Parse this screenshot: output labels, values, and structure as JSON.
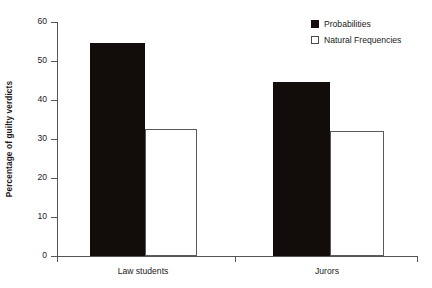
{
  "chart_data": {
    "type": "bar",
    "title": "",
    "xlabel": "",
    "ylabel": "Percentage of guilty verdicts",
    "categories": [
      "Law students",
      "Jurors"
    ],
    "series": [
      {
        "name": "Probabilities",
        "values": [
          54.5,
          44.5
        ],
        "style": "filled",
        "color": "#120d0b"
      },
      {
        "name": "Natural Frequencies",
        "values": [
          32.5,
          32.0
        ],
        "style": "open",
        "color": "#ffffff"
      }
    ],
    "ylim": [
      0,
      60
    ],
    "yticks": [
      0,
      10,
      20,
      30,
      40,
      50,
      60
    ],
    "ytick_labels": [
      "0",
      "10",
      "20",
      "30",
      "40",
      "50",
      "60"
    ],
    "grid": false,
    "legend_position": "top-right",
    "axis_color": "#555555"
  },
  "legend": {
    "entries": [
      {
        "label": "Probabilities",
        "marker": "filled-square-icon"
      },
      {
        "label": "Natural Frequencies",
        "marker": "open-square-icon"
      }
    ]
  }
}
